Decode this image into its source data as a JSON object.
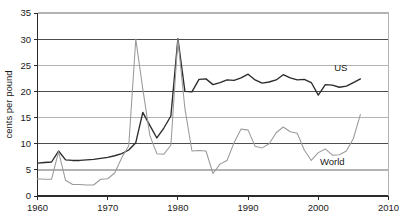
{
  "chart_data": {
    "type": "line",
    "title": "",
    "subtitle": "",
    "xlabel": "",
    "ylabel": "cents per pound",
    "xlim": [
      1960,
      2010
    ],
    "ylim": [
      0,
      35
    ],
    "xticks": [
      1960,
      1970,
      1980,
      1990,
      2000,
      2010
    ],
    "yticks": [
      0,
      5,
      10,
      15,
      20,
      25,
      30,
      35
    ],
    "grid": "horizontal",
    "legend_position": "inline-right",
    "colors": {
      "us": "#2b2b2b",
      "world": "#9a9a9a",
      "gridline_major": "#4d4d4d",
      "gridline_minor": "#b3b3b3",
      "axis": "#2b2b2b",
      "background": "#ffffff"
    },
    "series": [
      {
        "name": "US",
        "label": "US",
        "color": "#2b2b2b",
        "x": [
          1960,
          1961,
          1962,
          1963,
          1964,
          1965,
          1966,
          1967,
          1968,
          1969,
          1970,
          1971,
          1972,
          1973,
          1974,
          1975,
          1976,
          1977,
          1978,
          1979,
          1980,
          1981,
          1982,
          1983,
          1984,
          1985,
          1986,
          1987,
          1988,
          1989,
          1990,
          1991,
          1992,
          1993,
          1994,
          1995,
          1996,
          1997,
          1998,
          1999,
          2000,
          2001,
          2002,
          2003,
          2004,
          2005,
          2006
        ],
        "values": [
          6.3,
          6.4,
          6.5,
          8.6,
          6.9,
          6.8,
          6.8,
          6.9,
          7.0,
          7.2,
          7.4,
          7.7,
          8.1,
          8.8,
          10.2,
          16.0,
          13.5,
          11.1,
          13.0,
          15.3,
          30.1,
          20.0,
          19.9,
          22.3,
          22.4,
          21.3,
          21.7,
          22.2,
          22.1,
          22.6,
          23.3,
          22.2,
          21.6,
          21.8,
          22.2,
          23.2,
          22.6,
          22.2,
          22.3,
          21.7,
          19.3,
          21.3,
          21.2,
          20.8,
          21.0,
          21.7,
          22.4
        ]
      },
      {
        "name": "World",
        "label": "World",
        "color": "#9a9a9a",
        "x": [
          1960,
          1961,
          1962,
          1963,
          1964,
          1965,
          1966,
          1967,
          1968,
          1969,
          1970,
          1971,
          1972,
          1973,
          1974,
          1975,
          1976,
          1977,
          1978,
          1979,
          1980,
          1981,
          1982,
          1983,
          1984,
          1985,
          1986,
          1987,
          1988,
          1989,
          1990,
          1991,
          1992,
          1993,
          1994,
          1995,
          1996,
          1997,
          1998,
          1999,
          2000,
          2001,
          2002,
          2003,
          2004,
          2005,
          2006
        ],
        "values": [
          3.3,
          3.2,
          3.2,
          8.5,
          3.0,
          2.2,
          2.2,
          2.1,
          2.1,
          3.2,
          3.3,
          4.4,
          7.3,
          9.6,
          30.0,
          20.5,
          11.6,
          8.1,
          8.0,
          9.7,
          30.0,
          16.7,
          8.6,
          8.7,
          8.6,
          4.3,
          6.1,
          6.8,
          10.2,
          12.8,
          12.6,
          9.5,
          9.2,
          10.0,
          12.1,
          13.2,
          12.3,
          12.0,
          8.8,
          6.8,
          8.3,
          9.0,
          7.8,
          7.9,
          8.6,
          11.0,
          15.6
        ]
      }
    ],
    "annotations": [
      {
        "text": "US",
        "x": 2003.2,
        "y": 24.5
      },
      {
        "text": "World",
        "x": 2002.0,
        "y": 6.6
      }
    ]
  },
  "axes": {
    "y_tick_labels": [
      "0",
      "5",
      "10",
      "15",
      "20",
      "25",
      "30",
      "35"
    ],
    "x_tick_labels": [
      "1960",
      "1970",
      "1980",
      "1990",
      "2000",
      "2010"
    ],
    "y_axis_title": "cents per pound"
  }
}
